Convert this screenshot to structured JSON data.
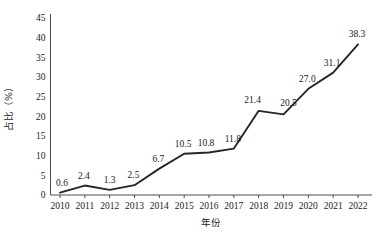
{
  "chart_data": {
    "type": "line",
    "title": "",
    "subtitle": "",
    "xlabel": "年份",
    "ylabel": "占比（%）",
    "categories": [
      "2010",
      "2011",
      "2012",
      "2013",
      "2014",
      "2015",
      "2016",
      "2017",
      "2018",
      "2019",
      "2020",
      "2021",
      "2022"
    ],
    "x": [
      2010,
      2011,
      2012,
      2013,
      2014,
      2015,
      2016,
      2017,
      2018,
      2019,
      2020,
      2021,
      2022
    ],
    "values": [
      0.6,
      2.4,
      1.3,
      2.5,
      6.7,
      10.5,
      10.8,
      11.8,
      21.4,
      20.5,
      27.0,
      31.1,
      38.3
    ],
    "point_labels": [
      "0.6",
      "2.4",
      "1.3",
      "2.5",
      "6.7",
      "10.5",
      "10.8",
      "11.8",
      "21.4",
      "20.5",
      "27.0",
      "31.1",
      "38.3"
    ],
    "yticks": [
      0,
      5,
      10,
      15,
      20,
      25,
      30,
      35,
      40,
      45
    ],
    "ytick_labels": [
      "0",
      "5",
      "10",
      "15",
      "20",
      "25",
      "30",
      "35",
      "40",
      "45"
    ],
    "ylim": [
      0,
      45
    ],
    "xlim": [
      2010,
      2022
    ],
    "grid": false,
    "legend": null,
    "legend_position": "none",
    "series_color": "#262626",
    "axis_color": "#4d4d4d",
    "background": "#ffffff"
  }
}
